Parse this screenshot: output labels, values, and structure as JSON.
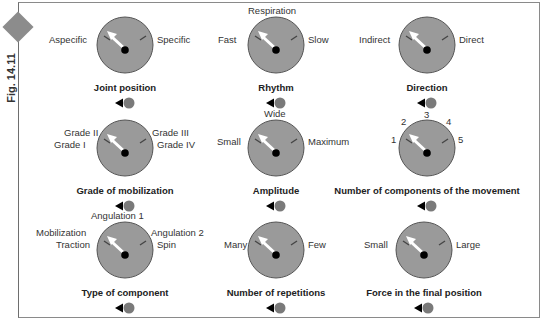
{
  "figure": {
    "label": "Fig. 14.11",
    "colors": {
      "dial_face": "#9a9a9a",
      "dial_border": "#555555",
      "needle": "#ffffff",
      "hub": "#000000",
      "control_circle": "#7a7a7a",
      "diamond": "#8c8c8c"
    }
  },
  "dials": [
    {
      "title": "Joint position",
      "labels": [
        "Aspecific",
        "Specific"
      ]
    },
    {
      "title": "Rhythm",
      "labels": [
        "Fast",
        "Respiration",
        "Slow"
      ]
    },
    {
      "title": "Direction",
      "labels": [
        "Indirect",
        "Direct"
      ]
    },
    {
      "title": "Grade of mobilization",
      "labels": [
        "Grade II",
        "Grade I",
        "Grade III",
        "Grade IV"
      ]
    },
    {
      "title": "Amplitude",
      "labels": [
        "Small",
        "Wide",
        "Maximum"
      ]
    },
    {
      "title": "Number of components of the movement",
      "labels": [
        "1",
        "2",
        "3",
        "4",
        "5"
      ]
    },
    {
      "title": "Type of component",
      "labels": [
        "Angulation 1",
        "Mobilization",
        "Traction",
        "Angulation 2",
        "Spin"
      ]
    },
    {
      "title": "Number of repetitions",
      "labels": [
        "Many",
        "Few"
      ]
    },
    {
      "title": "Force in the final position",
      "labels": [
        "Small",
        "Large"
      ]
    }
  ]
}
